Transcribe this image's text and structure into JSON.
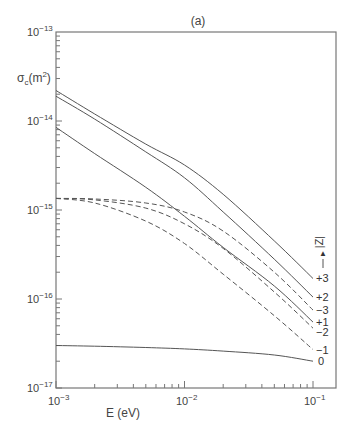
{
  "chart_data": {
    "type": "line",
    "title": "(a)",
    "xlabel": "E (eV)",
    "ylabel": "σc(m²)",
    "xscale": "log",
    "yscale": "log",
    "xlim": [
      0.001,
      0.13
    ],
    "ylim": [
      1e-17,
      1e-13
    ],
    "x_ticks": [
      "10^-3",
      "10^-2",
      "10^-1"
    ],
    "y_ticks": [
      "10^-13",
      "10^-14",
      "10^-15",
      "10^-16",
      "10^-17"
    ],
    "legend_title": "|Z|",
    "grid": false,
    "x": [
      0.001,
      0.002,
      0.005,
      0.01,
      0.02,
      0.05,
      0.1
    ],
    "series": [
      {
        "name": "+3",
        "style": "solid",
        "values": [
          2.2e-14,
          1.2e-14,
          5.5e-15,
          3.2e-15,
          1.5e-15,
          4.5e-16,
          1.7e-16
        ]
      },
      {
        "name": "+2",
        "style": "solid",
        "values": [
          1.9e-14,
          1.05e-14,
          4.5e-15,
          2.3e-15,
          9.5e-16,
          2.8e-16,
          1.05e-16
        ]
      },
      {
        "name": "+1",
        "style": "solid",
        "values": [
          8.5e-15,
          4.3e-15,
          1.8e-15,
          8.5e-16,
          3.8e-16,
          1.4e-16,
          5.5e-17
        ]
      },
      {
        "name": "0",
        "style": "solid",
        "values": [
          3e-17,
          2.95e-17,
          2.85e-17,
          2.75e-17,
          2.6e-17,
          2.35e-17,
          2e-17
        ]
      },
      {
        "name": "-3",
        "style": "dashed",
        "values": [
          1.35e-15,
          1.33e-15,
          1.2e-15,
          9.5e-16,
          5.8e-16,
          2e-16,
          7.5e-17
        ]
      },
      {
        "name": "-2",
        "style": "dashed",
        "values": [
          1.35e-15,
          1.3e-15,
          1.05e-15,
          7e-16,
          3.7e-16,
          1.2e-16,
          4.7e-17
        ]
      },
      {
        "name": "-1",
        "style": "dashed",
        "values": [
          1.35e-15,
          1.2e-15,
          7.5e-16,
          4.2e-16,
          1.9e-16,
          6.5e-17,
          2.7e-17
        ]
      }
    ]
  },
  "labels": {
    "panel": "(a)",
    "ylabel_main": "σ",
    "ylabel_sub": "c",
    "ylabel_unit": "(m",
    "ylabel_sup": "2",
    "ylabel_close": ")",
    "xlabel": "E (eV)",
    "legend_title": "|Z|",
    "legend_arrow": "▲",
    "y_tick_base": "10",
    "y_tick_exps": [
      "−13",
      "−14",
      "−15",
      "−16",
      "−17"
    ],
    "x_tick_base": "10",
    "x_tick_exps": [
      "−3",
      "−2",
      "−1"
    ],
    "curve_labels": [
      "+3",
      "+2",
      "−3",
      "+1",
      "−2",
      "−1",
      "0"
    ]
  }
}
